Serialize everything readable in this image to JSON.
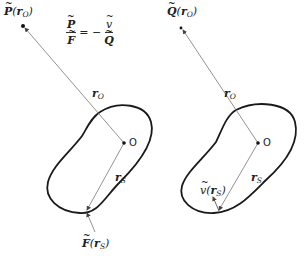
{
  "figure": {
    "left_panel": {
      "point_label": {
        "name": "P",
        "arg": "r",
        "arg_sub": "O"
      },
      "relation": {
        "lhs_num": "P",
        "lhs_den": "F",
        "eq": "= −",
        "rhs_num": "v",
        "rhs_den": "Q"
      },
      "r_o_label": {
        "base": "r",
        "sub": "O"
      },
      "origin_label": "O",
      "r_s_label": {
        "base": "r",
        "sub": "S"
      },
      "surface_label": {
        "name": "F",
        "arg": "r",
        "arg_sub": "S"
      }
    },
    "right_panel": {
      "point_label": {
        "name": "Q",
        "arg": "r",
        "arg_sub": "O"
      },
      "r_o_label": {
        "base": "r",
        "sub": "O"
      },
      "origin_label": "O",
      "r_s_label": {
        "base": "r",
        "sub": "S"
      },
      "normal_label": {
        "name": "v",
        "arg": "r",
        "arg_sub": "S"
      }
    },
    "colors": {
      "stroke": "#1a1a1a",
      "thin_line": "#666666",
      "background": "#ffffff"
    }
  }
}
